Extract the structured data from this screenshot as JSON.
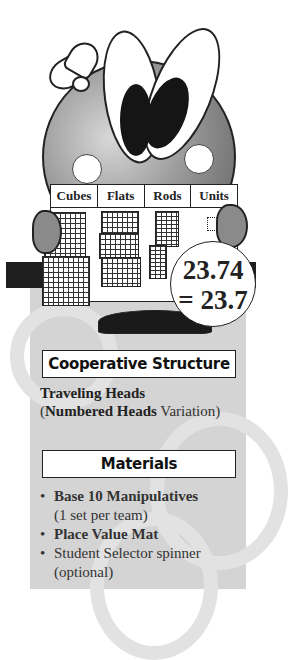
{
  "illustration": {
    "mat_columns": [
      "Cubes",
      "Flats",
      "Rods",
      "Units"
    ],
    "circle_line1": "23.74",
    "circle_line2": "= 23.7"
  },
  "cooperative_structure": {
    "title": "Cooperative Structure",
    "line1_bold": "Traveling Heads",
    "line2_open": "(",
    "line2_bold": "Numbered Heads",
    "line2_rest": " Variation)"
  },
  "materials": {
    "title": "Materials",
    "items": [
      {
        "bold": "Base 10 Manipulatives",
        "note": "(1 set per team)"
      },
      {
        "bold": "Place Value Mat",
        "note": ""
      },
      {
        "text": "Student Selector spinner",
        "note": "(optional)"
      }
    ]
  },
  "colors": {
    "panel": "#d4d4d4",
    "bar": "#1e1e1e",
    "ink": "#222222"
  }
}
